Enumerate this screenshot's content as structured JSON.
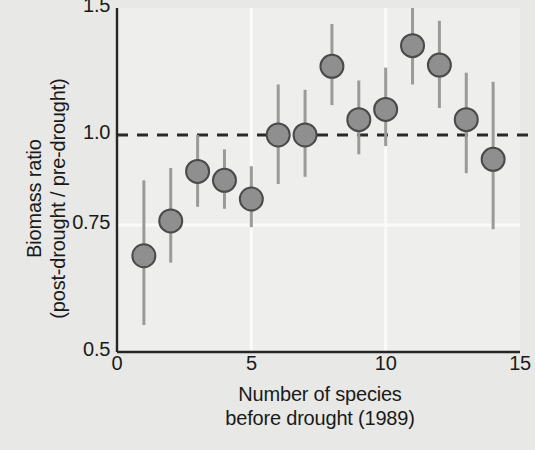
{
  "chart_data": {
    "type": "scatter",
    "title": "",
    "xlabel": "Number of species\nbefore drought (1989)",
    "ylabel": "Biomass ratio\n(post-drought / pre-drought)",
    "yscale": "log",
    "xlim": [
      0,
      15
    ],
    "ylim": [
      0.5,
      1.5
    ],
    "xticks": [
      "0",
      "5",
      "10",
      "15"
    ],
    "xtick_values": [
      0,
      5,
      10,
      15
    ],
    "yticks": [
      "1.5",
      "1.0",
      "0.75",
      "0.5"
    ],
    "ytick_values": [
      1.5,
      1.0,
      0.75,
      0.5
    ],
    "grid": "white gridlines at x=5, x=10 and y=0.75",
    "legend": "none",
    "reference_line": {
      "y": 1.0,
      "style": "dashed",
      "color": "#2a2a2a"
    },
    "marker": {
      "shape": "circle",
      "fill": "#8f8f8f",
      "edge": "#4a4a4a"
    },
    "errorbar_color": "#9a9a9a",
    "x": [
      1,
      2,
      3,
      4,
      5,
      6,
      7,
      8,
      9,
      10,
      11,
      12,
      13,
      14
    ],
    "values": [
      0.68,
      0.76,
      0.89,
      0.865,
      0.815,
      1.0,
      1.0,
      1.245,
      1.05,
      1.085,
      1.33,
      1.25,
      1.05,
      0.925
    ],
    "err_low": [
      0.545,
      0.665,
      0.795,
      0.79,
      0.745,
      0.855,
      0.875,
      1.1,
      0.94,
      0.965,
      1.175,
      1.09,
      0.885,
      0.74
    ],
    "err_high": [
      0.865,
      0.9,
      1.0,
      0.955,
      0.905,
      1.175,
      1.155,
      1.425,
      1.19,
      1.24,
      1.5,
      1.44,
      1.22,
      1.185
    ],
    "series_name": "Biomass ratio vs species richness"
  }
}
